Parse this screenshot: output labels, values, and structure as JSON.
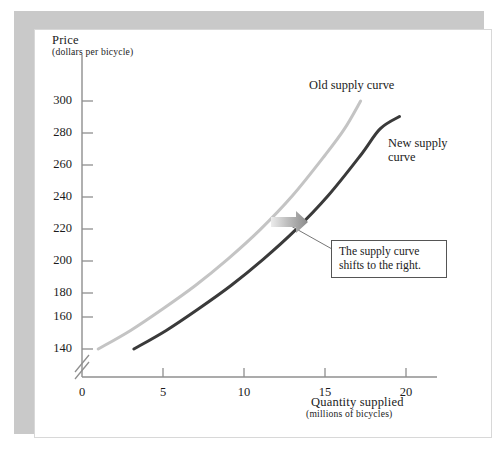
{
  "figure": {
    "background": "#ffffff",
    "frame_color": "#c9c9c9"
  },
  "chart_data": {
    "type": "line",
    "title": "",
    "xlabel_main": "Quantity supplied",
    "xlabel_sub": "(millions of bicycles)",
    "ylabel_main": "Price",
    "ylabel_sub": "(dollars per bicycle)",
    "xlim": [
      0,
      21.5
    ],
    "ylim": [
      132,
      312
    ],
    "xticks": [
      0,
      5,
      10,
      15,
      20
    ],
    "xtick_labels": [
      "0",
      "5",
      "10",
      "15",
      "20"
    ],
    "yticks": [
      140,
      160,
      180,
      200,
      220,
      240,
      260,
      280,
      300
    ],
    "ytick_labels": [
      "140",
      "160",
      "180",
      "200",
      "220",
      "240",
      "260",
      "280",
      "300"
    ],
    "grid": false,
    "axis_break": true,
    "legend_position": "inline-labels",
    "series": [
      {
        "name": "Old supply curve",
        "color": "#c4c4c4",
        "width": 3.0,
        "label": "Old supply curve",
        "points": [
          [
            1.0,
            140
          ],
          [
            3.0,
            152
          ],
          [
            5.0,
            166
          ],
          [
            7.0,
            181
          ],
          [
            9.0,
            198
          ],
          [
            11.0,
            217
          ],
          [
            13.0,
            239
          ],
          [
            15.0,
            265
          ],
          [
            16.2,
            282
          ],
          [
            17.2,
            300
          ]
        ]
      },
      {
        "name": "New supply curve",
        "color": "#3a3a3a",
        "width": 3.0,
        "label": "New supply curve",
        "points": [
          [
            3.2,
            140
          ],
          [
            5.2,
            152
          ],
          [
            7.2,
            166
          ],
          [
            9.2,
            181
          ],
          [
            11.2,
            198
          ],
          [
            13.2,
            217
          ],
          [
            15.2,
            239
          ],
          [
            17.2,
            265
          ],
          [
            18.4,
            282
          ],
          [
            19.6,
            290
          ]
        ]
      }
    ],
    "annotations": [
      {
        "name": "shift-arrow",
        "type": "arrow",
        "direction": "right",
        "color_start": "#e2e2e2",
        "color_end": "#8c8c8c"
      },
      {
        "name": "callout",
        "type": "text-box",
        "text": "The supply curve\nshifts to the right."
      }
    ]
  },
  "labels": {
    "old_curve": "Old supply curve",
    "new_curve": "New supply\ncurve",
    "callout": "The supply curve\nshifts to the right.",
    "y_axis_main": "Price",
    "y_axis_sub": "(dollars per bicycle)",
    "x_axis_main": "Quantity supplied",
    "x_axis_sub": "(millions of bicycles)"
  }
}
